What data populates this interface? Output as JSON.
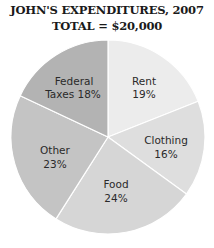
{
  "chart_data": {
    "type": "pie",
    "title": "JOHN'S EXPENDITURES, 2007",
    "subtitle": "TOTAL = $20,000",
    "categories": [
      "Rent",
      "Clothing",
      "Food",
      "Other",
      "Federal Taxes"
    ],
    "values": [
      19,
      16,
      24,
      23,
      18
    ],
    "labels": [
      "Rent 19%",
      "Clothing 16%",
      "Food 24%",
      "Other 23%",
      "Federal Taxes 18%"
    ],
    "colors": [
      "#ececec",
      "#dedede",
      "#d6d6d6",
      "#c4c4c4",
      "#b3b3b3"
    ],
    "start_angle": "12 o'clock, clockwise",
    "legend": "none"
  },
  "title_line1": "JOHN'S EXPENDITURES, 2007",
  "title_line2": "TOTAL = $20,000",
  "slices": [
    {
      "name": "Rent",
      "line1": "Rent",
      "line2": "19%"
    },
    {
      "name": "Clothing",
      "line1": "Clothing",
      "line2": "16%"
    },
    {
      "name": "Food",
      "line1": "Food",
      "line2": "24%"
    },
    {
      "name": "Other",
      "line1": "Other",
      "line2": "23%"
    },
    {
      "name": "Federal Taxes",
      "line1": "Federal",
      "line2": "Taxes 18%"
    }
  ]
}
